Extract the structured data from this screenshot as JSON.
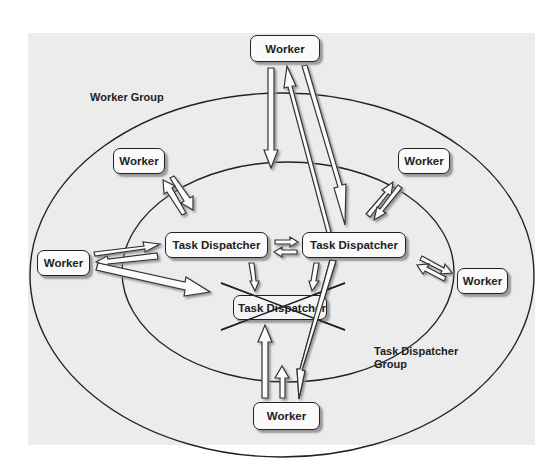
{
  "diagram": {
    "groups": {
      "worker_group": {
        "label": "Worker Group"
      },
      "dispatcher_group": {
        "label_line1": "Task Dispatcher",
        "label_line2": "Group"
      }
    },
    "workers": {
      "top": {
        "label": "Worker"
      },
      "upper_left": {
        "label": "Worker"
      },
      "upper_right": {
        "label": "Worker"
      },
      "left": {
        "label": "Worker"
      },
      "right": {
        "label": "Worker"
      },
      "bottom": {
        "label": "Worker"
      }
    },
    "dispatchers": {
      "left": {
        "label": "Task Dispatcher"
      },
      "right": {
        "label": "Task Dispatcher"
      },
      "failed": {
        "label": "Task Dispatcher",
        "status": "crossed-out"
      }
    },
    "colors": {
      "background": "#ececec",
      "stroke": "#222222",
      "node_fill": "#fafafa",
      "shadow": "#9a9a9a"
    }
  }
}
